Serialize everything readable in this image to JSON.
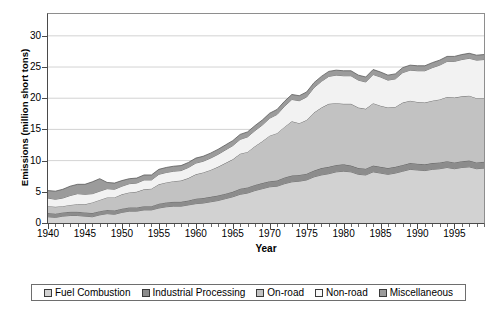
{
  "chart_data": {
    "type": "area",
    "stacked": true,
    "title": "",
    "xlabel": "Year",
    "ylabel": "Emissions (million short tons)",
    "xlim": [
      1940,
      1999
    ],
    "ylim": [
      0,
      33.5
    ],
    "yticks": [
      0,
      5,
      10,
      15,
      20,
      25,
      30
    ],
    "xticks": [
      1940,
      1945,
      1950,
      1955,
      1960,
      1965,
      1970,
      1975,
      1980,
      1985,
      1990,
      1995
    ],
    "grid": "horizontal",
    "legend_position": "bottom",
    "x": [
      1940,
      1941,
      1942,
      1943,
      1944,
      1945,
      1946,
      1947,
      1948,
      1949,
      1950,
      1951,
      1952,
      1953,
      1954,
      1955,
      1956,
      1957,
      1958,
      1959,
      1960,
      1961,
      1962,
      1963,
      1964,
      1965,
      1966,
      1967,
      1968,
      1969,
      1970,
      1971,
      1972,
      1973,
      1974,
      1975,
      1976,
      1977,
      1978,
      1979,
      1980,
      1981,
      1982,
      1983,
      1984,
      1985,
      1986,
      1987,
      1988,
      1989,
      1990,
      1991,
      1992,
      1993,
      1994,
      1995,
      1996,
      1997,
      1998,
      1999
    ],
    "series": [
      {
        "name": "Fuel Combustion",
        "color": "#d2d2d2",
        "values": [
          1.0,
          0.9,
          1.1,
          1.2,
          1.2,
          1.1,
          1.0,
          1.3,
          1.5,
          1.4,
          1.7,
          1.9,
          1.9,
          2.1,
          2.1,
          2.4,
          2.6,
          2.7,
          2.7,
          2.9,
          3.1,
          3.2,
          3.4,
          3.6,
          3.9,
          4.2,
          4.6,
          4.8,
          5.2,
          5.5,
          5.8,
          5.9,
          6.3,
          6.6,
          6.7,
          6.9,
          7.4,
          7.7,
          7.9,
          8.2,
          8.3,
          8.2,
          7.8,
          7.7,
          8.2,
          8.0,
          7.8,
          8.0,
          8.3,
          8.6,
          8.5,
          8.4,
          8.6,
          8.7,
          8.9,
          8.7,
          8.9,
          9.0,
          8.7,
          8.8
        ]
      },
      {
        "name": "Industrial Processing",
        "color": "#8c8c8c",
        "values": [
          0.6,
          0.6,
          0.6,
          0.6,
          0.6,
          0.6,
          0.6,
          0.6,
          0.6,
          0.6,
          0.6,
          0.6,
          0.6,
          0.6,
          0.6,
          0.7,
          0.7,
          0.7,
          0.7,
          0.7,
          0.8,
          0.8,
          0.8,
          0.8,
          0.8,
          0.8,
          0.9,
          0.9,
          0.9,
          0.9,
          0.9,
          0.9,
          1.0,
          1.0,
          1.0,
          1.0,
          1.0,
          1.1,
          1.1,
          1.1,
          1.1,
          1.0,
          1.0,
          1.0,
          1.0,
          1.0,
          1.0,
          1.0,
          1.0,
          1.0,
          1.0,
          1.0,
          1.0,
          1.0,
          1.0,
          1.0,
          1.0,
          1.0,
          1.0,
          1.0
        ]
      },
      {
        "name": "On-road",
        "color": "#c2c2c2",
        "values": [
          1.1,
          1.1,
          1.0,
          1.1,
          1.2,
          1.3,
          1.7,
          1.8,
          2.0,
          2.1,
          2.3,
          2.4,
          2.5,
          2.7,
          2.8,
          3.1,
          3.2,
          3.3,
          3.4,
          3.6,
          3.9,
          4.1,
          4.3,
          4.6,
          4.9,
          5.2,
          5.6,
          5.7,
          6.2,
          6.7,
          7.3,
          7.6,
          8.1,
          8.7,
          8.3,
          8.6,
          9.3,
          9.7,
          10.1,
          9.9,
          9.7,
          9.9,
          9.7,
          9.6,
          10.0,
          9.8,
          9.7,
          9.6,
          10.0,
          10.0,
          9.9,
          9.9,
          10.0,
          10.1,
          10.3,
          10.4,
          10.4,
          10.4,
          10.3,
          10.2
        ]
      },
      {
        "name": "Non-road",
        "color": "#f2f2f2",
        "values": [
          1.3,
          1.2,
          1.3,
          1.5,
          1.7,
          1.6,
          1.4,
          1.4,
          1.4,
          1.3,
          1.3,
          1.4,
          1.4,
          1.5,
          1.4,
          1.6,
          1.6,
          1.6,
          1.6,
          1.7,
          1.8,
          1.8,
          1.9,
          2.0,
          2.1,
          2.2,
          2.3,
          2.4,
          2.5,
          2.6,
          2.8,
          3.0,
          3.3,
          3.5,
          3.6,
          3.7,
          4.0,
          4.2,
          4.4,
          4.5,
          4.5,
          4.5,
          4.4,
          4.3,
          4.6,
          4.6,
          4.4,
          4.5,
          4.8,
          4.9,
          5.0,
          5.1,
          5.3,
          5.5,
          5.7,
          5.8,
          5.9,
          6.0,
          6.1,
          6.2
        ]
      },
      {
        "name": "Miscellaneous",
        "color": "#9b9b9b",
        "values": [
          1.2,
          1.3,
          1.4,
          1.5,
          1.5,
          1.6,
          1.9,
          2.0,
          1.0,
          1.0,
          0.9,
          0.8,
          0.8,
          0.8,
          0.8,
          0.8,
          0.8,
          0.8,
          0.8,
          0.8,
          0.8,
          0.8,
          0.8,
          0.8,
          0.8,
          0.8,
          0.8,
          0.8,
          0.8,
          0.8,
          0.8,
          0.8,
          0.8,
          0.8,
          0.8,
          0.8,
          0.8,
          0.8,
          0.8,
          0.8,
          0.8,
          0.8,
          0.8,
          0.8,
          0.8,
          0.8,
          0.8,
          0.8,
          0.8,
          0.8,
          0.8,
          0.8,
          0.8,
          0.8,
          0.8,
          0.8,
          0.8,
          0.8,
          0.8,
          0.8
        ]
      }
    ]
  },
  "axes": {
    "ylabel": "Emissions (million short tons)",
    "xlabel": "Year",
    "ytick_labels": [
      "0",
      "5",
      "10",
      "15",
      "20",
      "25",
      "30"
    ],
    "xtick_labels": [
      "1940",
      "1945",
      "1950",
      "1955",
      "1960",
      "1965",
      "1970",
      "1975",
      "1980",
      "1985",
      "1990",
      "1995"
    ]
  },
  "legend": {
    "items": [
      {
        "label": "Fuel Combustion",
        "color": "#d2d2d2"
      },
      {
        "label": "Industrial Processing",
        "color": "#8c8c8c"
      },
      {
        "label": "On-road",
        "color": "#c2c2c2"
      },
      {
        "label": "Non-road",
        "color": "#f8f8f8"
      },
      {
        "label": "Miscellaneous",
        "color": "#9b9b9b"
      }
    ]
  }
}
